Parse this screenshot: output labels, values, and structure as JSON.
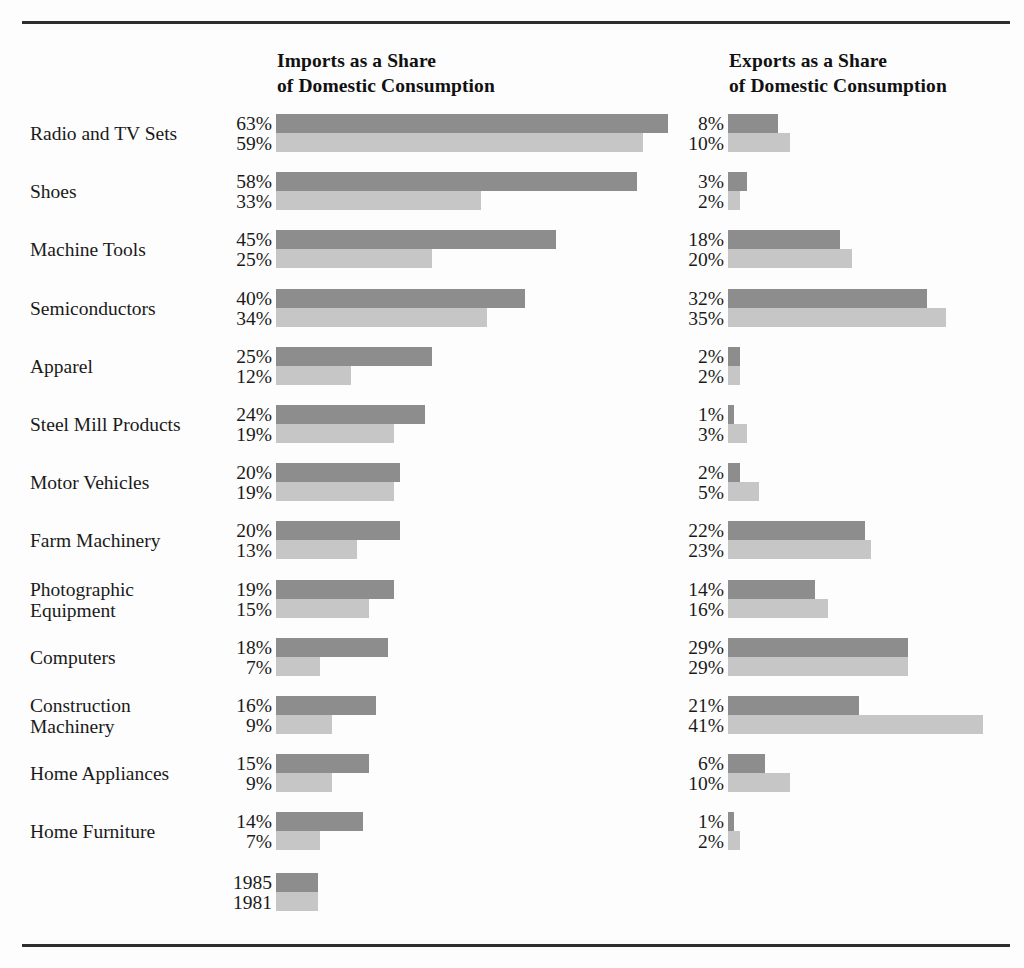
{
  "headers": {
    "imports": "Imports as a Share\nof Domestic Consumption",
    "exports": "Exports as a Share\nof Domestic Consumption"
  },
  "legend": {
    "series_1_label": "1985",
    "series_2_label": "1981"
  },
  "colors": {
    "series_1985": "#8d8d8d",
    "series_1981": "#c6c6c6",
    "rule": "#2e2e2e",
    "text": "#1a1a1a",
    "background": "#fdfdfd"
  },
  "chart_data": {
    "type": "bar",
    "title": "",
    "orientation": "horizontal",
    "grid": false,
    "legend_position": "bottom-left",
    "xlabel": "",
    "ylabel": "",
    "xlim": [
      0,
      63
    ],
    "panels": [
      {
        "name": "imports",
        "title": "Imports as a Share of Domestic Consumption"
      },
      {
        "name": "exports",
        "title": "Exports as a Share of Domestic Consumption"
      }
    ],
    "categories": [
      "Radio and TV Sets",
      "Shoes",
      "Machine Tools",
      "Semiconductors",
      "Apparel",
      "Steel Mill Products",
      "Motor Vehicles",
      "Farm Machinery",
      "Photographic\nEquipment",
      "Computers",
      "Construction\nMachinery",
      "Home Appliances",
      "Home Furniture"
    ],
    "series": [
      {
        "name": "1985",
        "panel": "imports",
        "values": [
          63,
          58,
          45,
          40,
          25,
          24,
          20,
          20,
          19,
          18,
          16,
          15,
          14
        ]
      },
      {
        "name": "1981",
        "panel": "imports",
        "values": [
          59,
          33,
          25,
          34,
          12,
          19,
          19,
          13,
          15,
          7,
          9,
          9,
          7
        ]
      },
      {
        "name": "1985",
        "panel": "exports",
        "values": [
          8,
          3,
          18,
          32,
          2,
          1,
          2,
          22,
          14,
          29,
          21,
          6,
          1
        ]
      },
      {
        "name": "1981",
        "panel": "exports",
        "values": [
          10,
          2,
          20,
          35,
          2,
          3,
          5,
          23,
          16,
          29,
          41,
          10,
          2
        ]
      }
    ]
  },
  "rows": [
    {
      "label": "Radio and TV Sets",
      "lines": 1,
      "imports": {
        "v1985": "63%",
        "v1981": "59%",
        "n1985": 63,
        "n1981": 59
      },
      "exports": {
        "v1985": "8%",
        "v1981": "10%",
        "n1985": 8,
        "n1981": 10
      }
    },
    {
      "label": "Shoes",
      "lines": 1,
      "imports": {
        "v1985": "58%",
        "v1981": "33%",
        "n1985": 58,
        "n1981": 33
      },
      "exports": {
        "v1985": "3%",
        "v1981": "2%",
        "n1985": 3,
        "n1981": 2
      }
    },
    {
      "label": "Machine Tools",
      "lines": 1,
      "imports": {
        "v1985": "45%",
        "v1981": "25%",
        "n1985": 45,
        "n1981": 25
      },
      "exports": {
        "v1985": "18%",
        "v1981": "20%",
        "n1985": 18,
        "n1981": 20
      }
    },
    {
      "label": "Semiconductors",
      "lines": 1,
      "imports": {
        "v1985": "40%",
        "v1981": "34%",
        "n1985": 40,
        "n1981": 34
      },
      "exports": {
        "v1985": "32%",
        "v1981": "35%",
        "n1985": 32,
        "n1981": 35
      }
    },
    {
      "label": "Apparel",
      "lines": 1,
      "imports": {
        "v1985": "25%",
        "v1981": "12%",
        "n1985": 25,
        "n1981": 12
      },
      "exports": {
        "v1985": "2%",
        "v1981": "2%",
        "n1985": 2,
        "n1981": 2
      }
    },
    {
      "label": "Steel Mill Products",
      "lines": 1,
      "imports": {
        "v1985": "24%",
        "v1981": "19%",
        "n1985": 24,
        "n1981": 19
      },
      "exports": {
        "v1985": "1%",
        "v1981": "3%",
        "n1985": 1,
        "n1981": 3
      }
    },
    {
      "label": "Motor Vehicles",
      "lines": 1,
      "imports": {
        "v1985": "20%",
        "v1981": "19%",
        "n1985": 20,
        "n1981": 19
      },
      "exports": {
        "v1985": "2%",
        "v1981": "5%",
        "n1985": 2,
        "n1981": 5
      }
    },
    {
      "label": "Farm Machinery",
      "lines": 1,
      "imports": {
        "v1985": "20%",
        "v1981": "13%",
        "n1985": 20,
        "n1981": 13
      },
      "exports": {
        "v1985": "22%",
        "v1981": "23%",
        "n1985": 22,
        "n1981": 23
      }
    },
    {
      "label": "Photographic\nEquipment",
      "lines": 2,
      "imports": {
        "v1985": "19%",
        "v1981": "15%",
        "n1985": 19,
        "n1981": 15
      },
      "exports": {
        "v1985": "14%",
        "v1981": "16%",
        "n1985": 14,
        "n1981": 16
      }
    },
    {
      "label": "Computers",
      "lines": 1,
      "imports": {
        "v1985": "18%",
        "v1981": "7%",
        "n1985": 18,
        "n1981": 7
      },
      "exports": {
        "v1985": "29%",
        "v1981": "29%",
        "n1985": 29,
        "n1981": 29
      }
    },
    {
      "label": "Construction\nMachinery",
      "lines": 2,
      "imports": {
        "v1985": "16%",
        "v1981": "9%",
        "n1985": 16,
        "n1981": 9
      },
      "exports": {
        "v1985": "21%",
        "v1981": "41%",
        "n1985": 21,
        "n1981": 41
      }
    },
    {
      "label": "Home Appliances",
      "lines": 1,
      "imports": {
        "v1985": "15%",
        "v1981": "9%",
        "n1985": 15,
        "n1981": 9
      },
      "exports": {
        "v1985": "6%",
        "v1981": "10%",
        "n1985": 6,
        "n1981": 10
      }
    },
    {
      "label": "Home Furniture",
      "lines": 1,
      "imports": {
        "v1985": "14%",
        "v1981": "7%",
        "n1985": 14,
        "n1981": 7
      },
      "exports": {
        "v1985": "1%",
        "v1981": "2%",
        "n1985": 1,
        "n1981": 2
      }
    }
  ],
  "layout": {
    "row_top_first": 114,
    "row_pitch": 58.2,
    "px_per_percent": 6.22,
    "legend_top": 873
  }
}
